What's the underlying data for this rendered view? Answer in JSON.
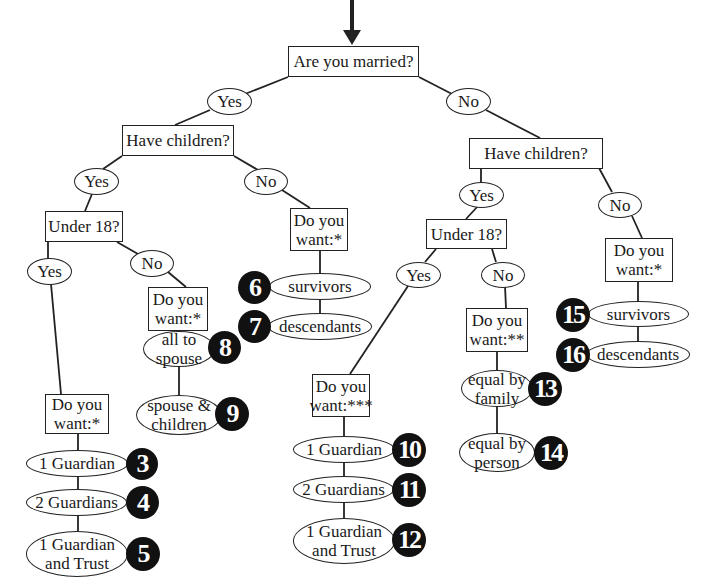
{
  "diagram": {
    "title_arrow": "entry-arrow",
    "root": {
      "label": "Are you married?"
    },
    "married_yes": "Yes",
    "married_no": "No",
    "married": {
      "question": "Have children?",
      "yes": "Yes",
      "no": "No",
      "children": {
        "question": "Under 18?",
        "yes": "Yes",
        "no": "No",
        "under18_yes": {
          "question": "Do you want:*",
          "options": [
            {
              "label": "1 Guardian",
              "number": "3"
            },
            {
              "label": "2 Guardians",
              "number": "4"
            },
            {
              "label": "1 Guardian and Trust",
              "number": "5"
            }
          ]
        },
        "under18_no": {
          "question": "Do you want:*",
          "options": [
            {
              "label": "all to spouse",
              "number": "8"
            },
            {
              "label": "spouse & children",
              "number": "9"
            }
          ]
        }
      },
      "no_children": {
        "question": "Do you want:*",
        "options": [
          {
            "label": "survivors",
            "number": "6"
          },
          {
            "label": "descendants",
            "number": "7"
          }
        ]
      }
    },
    "single": {
      "question": "Have children?",
      "yes": "Yes",
      "no": "No",
      "children": {
        "question": "Under 18?",
        "yes": "Yes",
        "no": "No",
        "under18_yes": {
          "question": "Do you want:***",
          "options": [
            {
              "label": "1 Guardian",
              "number": "10"
            },
            {
              "label": "2 Guardians",
              "number": "11"
            },
            {
              "label": "1 Guardian and Trust",
              "number": "12"
            }
          ]
        },
        "under18_no": {
          "question": "Do you want:**",
          "options": [
            {
              "label": "equal by family",
              "number": "13"
            },
            {
              "label": "equal by person",
              "number": "14"
            }
          ]
        }
      },
      "no_children": {
        "question": "Do you want:*",
        "options": [
          {
            "label": "survivors",
            "number": "15"
          },
          {
            "label": "descendants",
            "number": "16"
          }
        ]
      }
    }
  },
  "colors": {
    "line": "#222222",
    "badge": "#111111",
    "background": "#ffffff"
  }
}
